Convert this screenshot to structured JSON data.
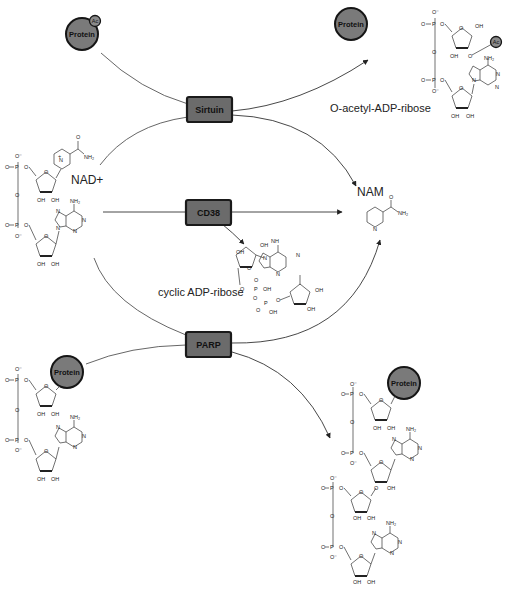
{
  "diagram": {
    "enzymes": [
      {
        "id": "sirtuin",
        "label": "Sirtuin"
      },
      {
        "id": "cd38",
        "label": "CD38"
      },
      {
        "id": "parp",
        "label": "PARP"
      }
    ],
    "molecules": {
      "nad": {
        "label": "NAD+"
      },
      "nam": {
        "label": "NAM"
      },
      "oaadpr": {
        "label": "O-acetyl-ADP-ribose"
      },
      "cadpr": {
        "label": "cyclic ADP-ribose"
      }
    },
    "proteins": {
      "label": "Protein",
      "acetyl_label": "Ac"
    },
    "atoms": {
      "o": "O",
      "o_minus": "O⁻",
      "p": "P",
      "oh": "OH",
      "n": "N",
      "nh2": "NH₂",
      "nh": "NH",
      "plus": "+"
    },
    "edges": [
      {
        "from": "Protein-Ac",
        "via": "Sirtuin",
        "to": "Protein"
      },
      {
        "from": "NAD+",
        "via": "Sirtuin",
        "to": "NAM"
      },
      {
        "from": "Sirtuin",
        "to": "O-acetyl-ADP-ribose"
      },
      {
        "from": "NAD+",
        "via": "CD38",
        "to": "NAM"
      },
      {
        "from": "CD38",
        "to": "cyclic ADP-ribose"
      },
      {
        "from": "NAD+",
        "via": "PARP",
        "to": "NAM"
      },
      {
        "from": "Protein-ADP-ribose",
        "via": "PARP",
        "to": "Protein-poly(ADP-ribose)"
      }
    ]
  }
}
